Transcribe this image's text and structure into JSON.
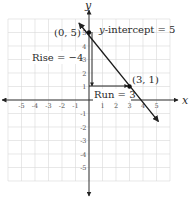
{
  "chart_data": {
    "type": "line",
    "title": "",
    "xlabel": "x",
    "ylabel": "y",
    "xlim": [
      -6,
      6
    ],
    "ylim": [
      -6,
      6
    ],
    "grid": true,
    "x_ticks": [
      "-5",
      "-4",
      "-3",
      "-2",
      "-1",
      "1",
      "2",
      "3",
      "4",
      "5"
    ],
    "y_ticks": [
      "5",
      "4",
      "3",
      "2",
      "1",
      "-1",
      "-2",
      "-3",
      "-4",
      "-5"
    ],
    "series": [
      {
        "name": "line",
        "slope": -1.3333,
        "intercept": 5,
        "x": [
          -0.75,
          0,
          3,
          5
        ],
        "y": [
          6,
          5,
          1,
          -1.67
        ]
      }
    ],
    "points": [
      {
        "label": "(0, 5)",
        "x": 0,
        "y": 5
      },
      {
        "label": "(3, 1)",
        "x": 3,
        "y": 1
      }
    ],
    "annotations": {
      "y_intercept_var": "y",
      "y_intercept_rest": "-intercept = 5",
      "rise": "Rise = −4",
      "run": "Run = 3"
    },
    "colors": {
      "line": "#1a1a1a",
      "grid": "#d8d8d8",
      "axis": "#333333",
      "point": "#111111"
    }
  }
}
